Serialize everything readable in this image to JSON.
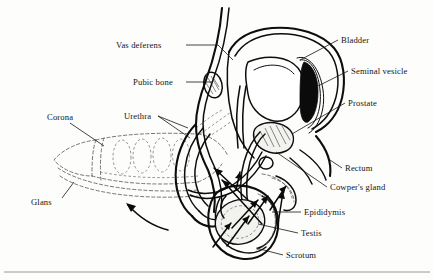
{
  "figure": {
    "caption_rule_visible": true,
    "background_color": "#fdfdfc",
    "ink_color": "#0d0d0d",
    "ghost_color": "#5d5d5d"
  },
  "labels": {
    "vas_deferens": "Vas deferens",
    "pubic_bone": "Pubic bone",
    "urethra": "Urethra",
    "corona": "Corona",
    "glans": "Glans",
    "bladder": "Bladder",
    "seminal_vesicle": "Seminal vesicle",
    "prostate": "Prostate",
    "rectum": "Rectum",
    "cowpers_gland": "Cowper's gland",
    "epididymis": "Epididymis",
    "testis": "Testis",
    "scrotum": "Scrotum"
  },
  "label_layout": [
    {
      "key": "vas_deferens",
      "text": "Vas deferens",
      "x": 116,
      "y": 48,
      "anchor": "start"
    },
    {
      "key": "pubic_bone",
      "text": "Pubic bone",
      "x": 133,
      "y": 85,
      "anchor": "start"
    },
    {
      "key": "urethra",
      "text": "Urethra",
      "x": 124,
      "y": 119,
      "anchor": "start"
    },
    {
      "key": "corona",
      "text": "Corona",
      "x": 47,
      "y": 120,
      "anchor": "start"
    },
    {
      "key": "glans",
      "text": "Glans",
      "x": 31,
      "y": 205,
      "anchor": "start"
    },
    {
      "key": "bladder",
      "text": "Bladder",
      "x": 341,
      "y": 43,
      "anchor": "start"
    },
    {
      "key": "seminal_vesicle",
      "text": "Seminal vesicle",
      "x": 351,
      "y": 74,
      "anchor": "start"
    },
    {
      "key": "prostate",
      "text": "Prostate",
      "x": 348,
      "y": 106,
      "anchor": "start"
    },
    {
      "key": "rectum",
      "text": "Rectum",
      "x": 345,
      "y": 171,
      "anchor": "start"
    },
    {
      "key": "cowpers_gland",
      "text": "Cowper's gland",
      "x": 330,
      "y": 190,
      "anchor": "start"
    },
    {
      "key": "epididymis",
      "text": "Epididymis",
      "x": 304,
      "y": 215,
      "anchor": "start"
    },
    {
      "key": "testis",
      "text": "Testis",
      "x": 301,
      "y": 236,
      "anchor": "start"
    },
    {
      "key": "scrotum",
      "text": "Scrotum",
      "x": 286,
      "y": 258,
      "anchor": "start"
    }
  ],
  "structures": [
    {
      "name": "bladder",
      "style": "white-outline"
    },
    {
      "name": "seminal-vesicle",
      "style": "dark-filled"
    },
    {
      "name": "prostate",
      "style": "hatched"
    },
    {
      "name": "rectum",
      "style": "outline"
    },
    {
      "name": "cowpers-gland",
      "style": "outline"
    },
    {
      "name": "vas-deferens",
      "style": "double-line"
    },
    {
      "name": "urethra",
      "style": "double-line"
    },
    {
      "name": "pubic-bone",
      "style": "hatched-oval"
    },
    {
      "name": "testis",
      "style": "pale-filled"
    },
    {
      "name": "epididymis",
      "style": "outline"
    },
    {
      "name": "scrotum",
      "style": "outline"
    },
    {
      "name": "penis-erect",
      "style": "outline"
    },
    {
      "name": "penis-flaccid",
      "style": "dashed-ghost"
    },
    {
      "name": "corona",
      "style": "dashed-ghost"
    },
    {
      "name": "glans",
      "style": "dashed-ghost"
    }
  ],
  "annotations": {
    "sperm_flow_arrows": 9,
    "flaccid_transition_arrow": 1
  }
}
